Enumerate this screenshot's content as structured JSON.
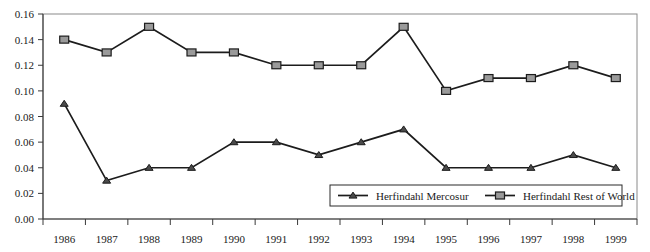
{
  "chart_data": {
    "type": "line",
    "title": "",
    "subtitle": "",
    "xlabel": "",
    "ylabel": "",
    "categories": [
      "1986",
      "1987",
      "1988",
      "1989",
      "1990",
      "1991",
      "1992",
      "1993",
      "1994",
      "1995",
      "1996",
      "1997",
      "1998",
      "1999"
    ],
    "ylim": [
      0.0,
      0.16
    ],
    "ytick_labels": [
      "0.00",
      "0.02",
      "0.04",
      "0.06",
      "0.08",
      "0.10",
      "0.12",
      "0.14",
      "0.16"
    ],
    "ytick_values": [
      0.0,
      0.02,
      0.04,
      0.06,
      0.08,
      0.1,
      0.12,
      0.14,
      0.16
    ],
    "grid": false,
    "legend_position": "inside-bottom-right",
    "series": [
      {
        "name": "Herfindahl Mercosur",
        "marker": "triangle",
        "marker_color": "#4a4a4a",
        "line_color": "#1c1c1c",
        "values": [
          0.09,
          0.03,
          0.04,
          0.04,
          0.06,
          0.06,
          0.05,
          0.06,
          0.07,
          0.04,
          0.04,
          0.04,
          0.05,
          0.04
        ]
      },
      {
        "name": "Herfindahl Rest of World",
        "marker": "square",
        "marker_color": "#9a9a9a",
        "line_color": "#1c1c1c",
        "values": [
          0.14,
          0.13,
          0.15,
          0.13,
          0.13,
          0.12,
          0.12,
          0.12,
          0.15,
          0.1,
          0.11,
          0.11,
          0.12,
          0.11
        ]
      }
    ]
  },
  "legend": {
    "items": [
      {
        "label": "Herfindahl Mercosur"
      },
      {
        "label": "Herfindahl Rest of World"
      }
    ]
  },
  "colors": {
    "line": "#1c1c1c",
    "square_marker": "#9a9a9a",
    "triangle_marker": "#4a4a4a",
    "frame": "#8a8a8a",
    "text": "#1a1a1a"
  }
}
